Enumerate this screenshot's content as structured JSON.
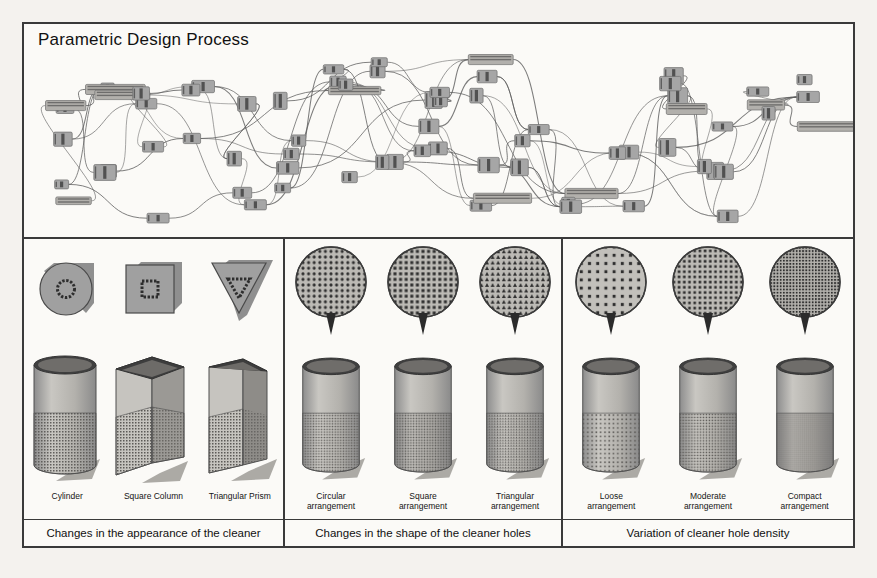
{
  "figure": {
    "title": "Parametric Design Process",
    "background_color": "#f4f2ee",
    "frame_color": "#3a3a3a",
    "paper_color": "#fbfaf7"
  },
  "graph": {
    "name": "parametric-node-graph",
    "description": "Grasshopper-style visual-programming node network",
    "node_color": "#a6a6a6",
    "node_border_color": "#6f6f6f",
    "wire_color": "#5c5c5c",
    "node_count": 78,
    "wire_count": 96
  },
  "panels": [
    {
      "id": "appearance",
      "caption": "Changes in the appearance of the cleaner",
      "items": [
        {
          "label_line1": "Cylinder",
          "label_line2": "",
          "swatch": "circle",
          "model": "cylinder"
        },
        {
          "label_line1": "Square Column",
          "label_line2": "",
          "swatch": "square",
          "model": "square-column"
        },
        {
          "label_line1": "Triangular Prism",
          "label_line2": "",
          "swatch": "triangle",
          "model": "triangular-prism"
        }
      ]
    },
    {
      "id": "holeshape",
      "caption": "Changes in the shape of the cleaner holes",
      "items": [
        {
          "label_line1": "Circular",
          "label_line2": "arrangement",
          "swatch": "perforated-circle-round",
          "model": "cylinder"
        },
        {
          "label_line1": "Square",
          "label_line2": "arrangement",
          "swatch": "perforated-circle-square",
          "model": "cylinder"
        },
        {
          "label_line1": "Triangular",
          "label_line2": "arrangement",
          "swatch": "perforated-circle-triangle",
          "model": "cylinder"
        }
      ]
    },
    {
      "id": "density",
      "caption": "Variation of cleaner hole density",
      "items": [
        {
          "label_line1": "Loose",
          "label_line2": "arrangement",
          "swatch": "perforated-circle-loose",
          "model": "cylinder"
        },
        {
          "label_line1": "Moderate",
          "label_line2": "arrangement",
          "swatch": "perforated-circle-moderate",
          "model": "cylinder"
        },
        {
          "label_line1": "Compact",
          "label_line2": "arrangement",
          "swatch": "perforated-circle-compact",
          "model": "cylinder"
        }
      ]
    }
  ]
}
